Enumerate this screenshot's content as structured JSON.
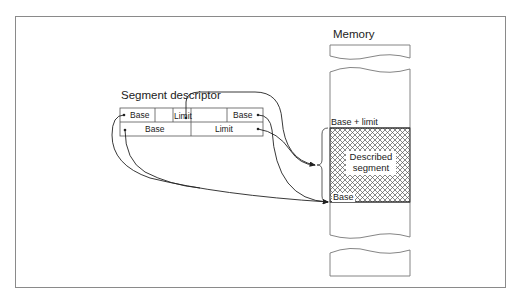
{
  "diagram": {
    "memory_label": "Memory",
    "descriptor_label": "Segment descriptor",
    "descriptor": {
      "row1": [
        "Base",
        "",
        "Limit",
        "",
        "Base"
      ],
      "row2": [
        "Base",
        "Limit"
      ]
    },
    "memory_markers": {
      "top": "Base + limit",
      "bottom": "Base"
    },
    "segment_label": "Described segment",
    "colors": {
      "line": "#333333",
      "frame": "#8a8a8a",
      "hatch": "#555555"
    }
  }
}
